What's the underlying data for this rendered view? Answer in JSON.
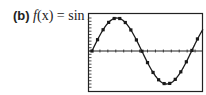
{
  "label": {
    "part": "(b)",
    "fname": "f",
    "arg": "(x)",
    "eq": " = ",
    "rhs": "sin ",
    "var": "x"
  },
  "colors": {
    "ink": "#1a1a1a",
    "frame": "#222222"
  },
  "chart_data": {
    "type": "line",
    "title": "f(x) = sin x",
    "xlabel": "",
    "ylabel": "",
    "function": "sin(x)",
    "xlim": [
      0,
      7.0
    ],
    "ylim": [
      -1.5,
      1.5
    ],
    "grid": false,
    "markers": true,
    "x": [
      0.0,
      0.35,
      0.7,
      1.05,
      1.4,
      1.75,
      2.1,
      2.45,
      2.8,
      3.15,
      3.5,
      3.85,
      4.2,
      4.55,
      4.9,
      5.25,
      5.6,
      5.95,
      6.3,
      6.65
    ],
    "y": [
      0.0,
      0.343,
      0.644,
      0.867,
      0.985,
      0.984,
      0.863,
      0.638,
      0.335,
      -0.008,
      -0.351,
      -0.65,
      -0.872,
      -0.987,
      -0.982,
      -0.859,
      -0.631,
      -0.327,
      0.017,
      0.365
    ]
  }
}
